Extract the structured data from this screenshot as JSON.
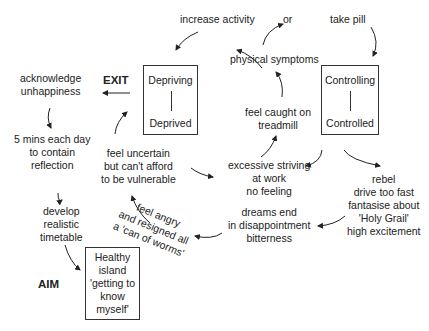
{
  "nodes": {
    "increase_activity": "increase activity",
    "or": "or",
    "take_pill": "take pill",
    "physical_symptoms": "physical symptoms",
    "exit": "EXIT",
    "aim": "AIM",
    "acknowledge": [
      "acknowledge",
      "unhappiness"
    ],
    "five_mins": [
      "5 mins each day",
      "to contain",
      "reflection"
    ],
    "develop": [
      "develop",
      "realistic",
      "timetable"
    ],
    "feel_uncertain": [
      "feel uncertain",
      "but can't afford",
      "to be vulnerable"
    ],
    "feel_caught": [
      "feel caught on",
      "treadmill"
    ],
    "excessive": [
      "excessive striving",
      "at work",
      "no feeling"
    ],
    "dreams": [
      "dreams end",
      "in disappointment",
      "bitterness"
    ],
    "rebel": [
      "rebel",
      "drive too fast",
      "fantasise about",
      "'Holy Grail'",
      "high excitement"
    ],
    "feel_angry": [
      "feel angry",
      "and resigned all",
      "a 'can of worms'"
    ]
  },
  "boxes": {
    "depriving": {
      "top": "Depriving",
      "bottom": "Deprived"
    },
    "controlling": {
      "top": "Controlling",
      "bottom": "Controlled"
    },
    "healthy": [
      "Healthy",
      "island",
      "'getting to",
      "know",
      "myself'"
    ]
  }
}
